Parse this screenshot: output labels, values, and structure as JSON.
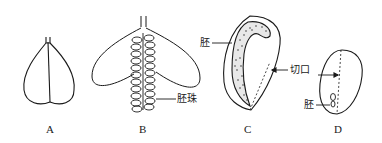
{
  "diagram": {
    "figures": [
      {
        "id": "A",
        "label": "A"
      },
      {
        "id": "B",
        "label": "B",
        "annotations": [
          {
            "text": "胚珠"
          }
        ]
      },
      {
        "id": "C",
        "label": "C",
        "annotations": [
          {
            "text": "胚"
          },
          {
            "text": "切口"
          }
        ]
      },
      {
        "id": "D",
        "label": "D",
        "annotations": [
          {
            "text": "胚"
          }
        ]
      }
    ],
    "colors": {
      "stroke": "#1a1a1a",
      "background": "#ffffff"
    }
  }
}
